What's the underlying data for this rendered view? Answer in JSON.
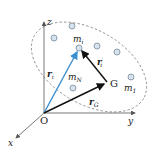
{
  "diagram": {
    "type": "center-of-mass position vectors",
    "colors": {
      "axes": "#555555",
      "ellipse": "#888888",
      "particle_fill": "#d6e2ee",
      "particle_stroke": "#7a8a99",
      "r_i": "#3a8fd0",
      "vectors": "#111111"
    },
    "axes": {
      "origin": "O",
      "x": "x",
      "y": "y",
      "z": "z"
    },
    "points": {
      "center_of_mass": "G",
      "particle_i": "m",
      "particle_i_sub": "i",
      "particle_1": "m",
      "particle_1_sub": "1",
      "particle_N": "m",
      "particle_N_sub": "N"
    },
    "vectors": {
      "r_i": "r",
      "r_i_sub": "i",
      "r_G": "r",
      "r_G_sub": "G",
      "r_i_prime": "r",
      "r_i_prime_sub": "i",
      "r_i_prime_mark": "′"
    }
  }
}
